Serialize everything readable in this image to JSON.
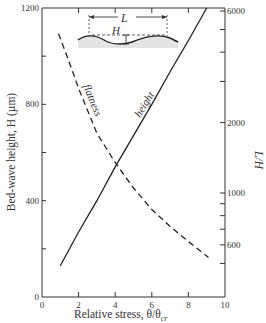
{
  "chart_data": {
    "type": "line",
    "title": "",
    "xlabel": "Relative stress, θ/θcr",
    "ylabel": "Bed-wave height, H (µm)",
    "y2label": "L/H",
    "xlim": [
      0,
      10
    ],
    "ylim": [
      0,
      1200
    ],
    "y2lim_log": [
      400,
      6000
    ],
    "y2scale": "log",
    "grid": false,
    "x_ticks": [
      0,
      2,
      4,
      6,
      8,
      10
    ],
    "x_tick_labels": [
      "0",
      "2",
      "4",
      "6",
      "8",
      "10"
    ],
    "y_ticks": [
      0,
      200,
      400,
      600,
      800,
      1000,
      1200
    ],
    "y_tick_labels": [
      "0",
      "",
      "400",
      "",
      "800",
      "",
      "1200"
    ],
    "y2_ticks": [
      500,
      600,
      700,
      800,
      900,
      1000,
      2000,
      3000,
      4000,
      5000,
      6000
    ],
    "y2_tick_labels": [
      "",
      "600",
      "",
      "",
      "",
      "1000",
      "2000",
      "",
      "",
      "",
      "6000"
    ],
    "series": [
      {
        "name": "height",
        "axis": "left",
        "style": "solid",
        "x": [
          1.0,
          2.0,
          3.0,
          4.0,
          5.0,
          6.0,
          7.0,
          8.0,
          9.0
        ],
        "values": [
          130,
          270,
          400,
          540,
          670,
          800,
          935,
          1065,
          1200
        ]
      },
      {
        "name": "flatness",
        "axis": "right",
        "style": "dashed",
        "x": [
          0.9,
          1.5,
          2.0,
          3.0,
          4.0,
          5.0,
          6.0,
          7.0,
          8.0,
          9.1
        ],
        "values": [
          4800,
          3600,
          2800,
          1800,
          1350,
          1050,
          850,
          720,
          620,
          530
        ]
      }
    ],
    "annotations": [
      {
        "text": "height",
        "type": "series-label"
      },
      {
        "text": "flatness",
        "type": "series-label"
      },
      {
        "text": "L",
        "type": "inset-label",
        "meaning": "wavelength"
      },
      {
        "text": "H",
        "type": "inset-label",
        "meaning": "wave height"
      }
    ],
    "legend_position": "none"
  },
  "labels": {
    "xlabel": "Relative stress, θ/θ",
    "xlabel_sub": "cr",
    "ylabel": "Bed-wave height, H (µm)",
    "y2label": "L/H",
    "series_height": "height",
    "series_flatness": "flatness",
    "inset_L": "L",
    "inset_H": "H"
  }
}
